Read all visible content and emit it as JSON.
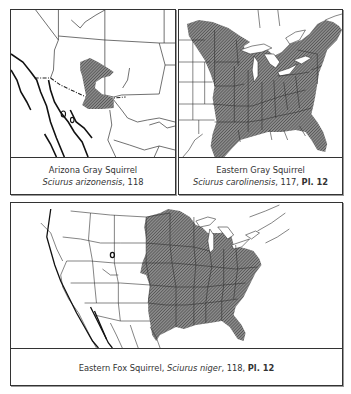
{
  "panels": [
    {
      "id": "arizona-gray-squirrel",
      "common_name": "Arizona Gray Squirrel",
      "scientific_name": "Sciurus arizonensis",
      "page": ", 118",
      "plate": ""
    },
    {
      "id": "eastern-gray-squirrel",
      "common_name": "Eastern Gray Squirrel",
      "scientific_name": "Sciurus carolinensis",
      "page": ", 117, ",
      "plate": "Pl. 12"
    },
    {
      "id": "eastern-fox-squirrel",
      "common_name": "Eastern Fox Squirrel, ",
      "scientific_name": "Sciurus niger",
      "page": ", 118, ",
      "plate": "Pl. 12"
    }
  ],
  "colors": {
    "range_fill": "#6e6e6e",
    "border": "#333333",
    "background": "#ffffff"
  }
}
